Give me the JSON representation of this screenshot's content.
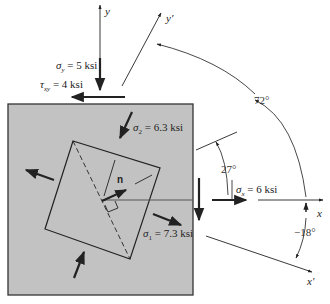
{
  "diagram": {
    "type": "plane-stress-element-principal-directions",
    "colors": {
      "element_fill": "#c2c2c2",
      "element_border": "#333333",
      "line": "#222222",
      "background": "#ffffff"
    },
    "axes": {
      "y": "y",
      "y_prime": "y′",
      "x": "x",
      "x_prime": "x′"
    },
    "stresses": {
      "sigma_y": {
        "symbol": "σ",
        "sub": "y",
        "value": "= 5 ksi"
      },
      "tau_xy": {
        "symbol": "τ",
        "sub": "xy",
        "value": "= 4 ksi"
      },
      "sigma_x": {
        "symbol": "σ",
        "sub": "x",
        "value": "= 6 ksi"
      },
      "sigma_1": {
        "symbol": "σ",
        "sub": "1",
        "value": "= 7.3 ksi"
      },
      "sigma_2": {
        "symbol": "σ",
        "sub": "2",
        "value": "= 6.3 ksi"
      }
    },
    "normal_vector_label": "n",
    "angles": {
      "arc_y_prime": "72°",
      "rotation": "27°",
      "arc_x_prime": "−18°"
    }
  }
}
